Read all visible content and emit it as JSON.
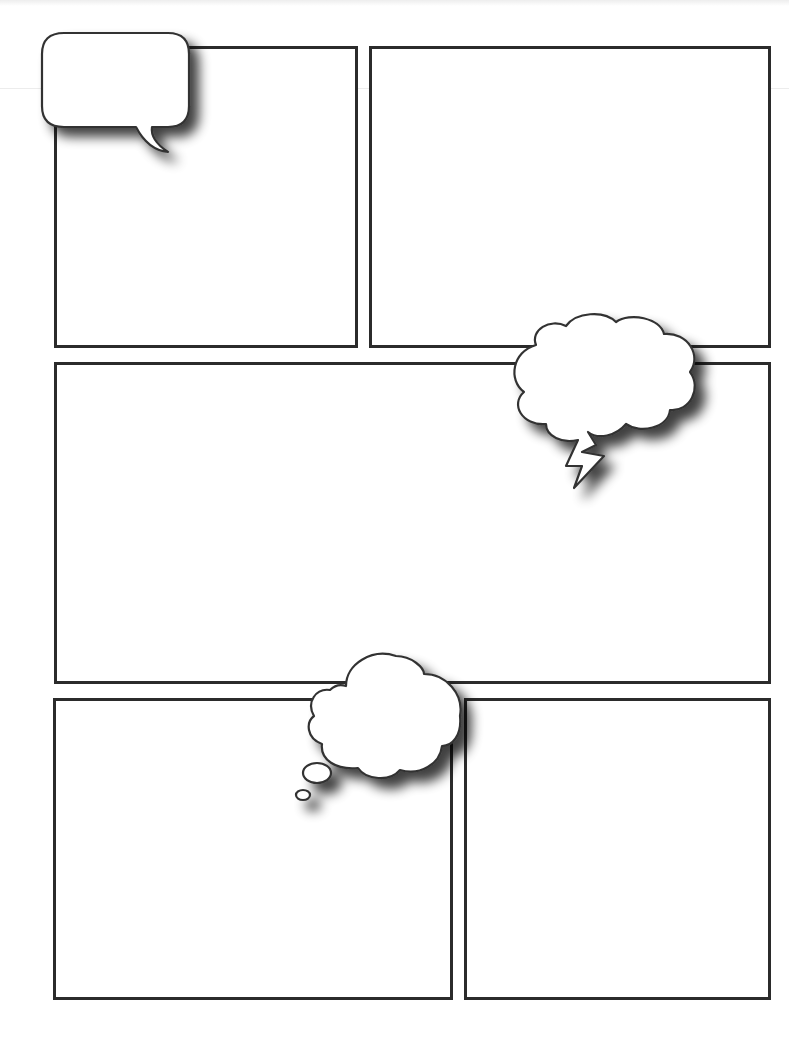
{
  "page": {
    "title": "",
    "background": "#ffffff",
    "border_color": "#2b2b2b"
  },
  "panels": [
    {
      "id": "panel-1",
      "text": "",
      "x": 54,
      "y": 46,
      "w": 304,
      "h": 302
    },
    {
      "id": "panel-2",
      "text": "",
      "x": 369,
      "y": 46,
      "w": 402,
      "h": 302
    },
    {
      "id": "panel-3",
      "text": "",
      "x": 54,
      "y": 362,
      "w": 717,
      "h": 322
    },
    {
      "id": "panel-4",
      "text": "",
      "x": 53,
      "y": 698,
      "w": 400,
      "h": 302
    },
    {
      "id": "panel-5",
      "text": "",
      "x": 464,
      "y": 698,
      "w": 307,
      "h": 302
    }
  ],
  "bubbles": [
    {
      "id": "speech-bubble",
      "type": "speech",
      "text": ""
    },
    {
      "id": "shout-bubble",
      "type": "cloud-with-lightning-tail",
      "text": ""
    },
    {
      "id": "thought-bubble",
      "type": "thought",
      "text": ""
    }
  ]
}
